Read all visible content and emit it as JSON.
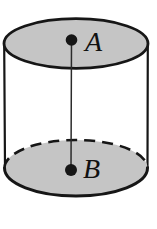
{
  "diagram": {
    "type": "cylinder",
    "labels": {
      "top_point": "A",
      "bottom_point": "B"
    },
    "colors": {
      "background": "#ffffff",
      "face_fill": "#c5c5c5",
      "outline": "#161616",
      "axis_line": "#2b2b2b",
      "label_color": "#111111"
    }
  }
}
